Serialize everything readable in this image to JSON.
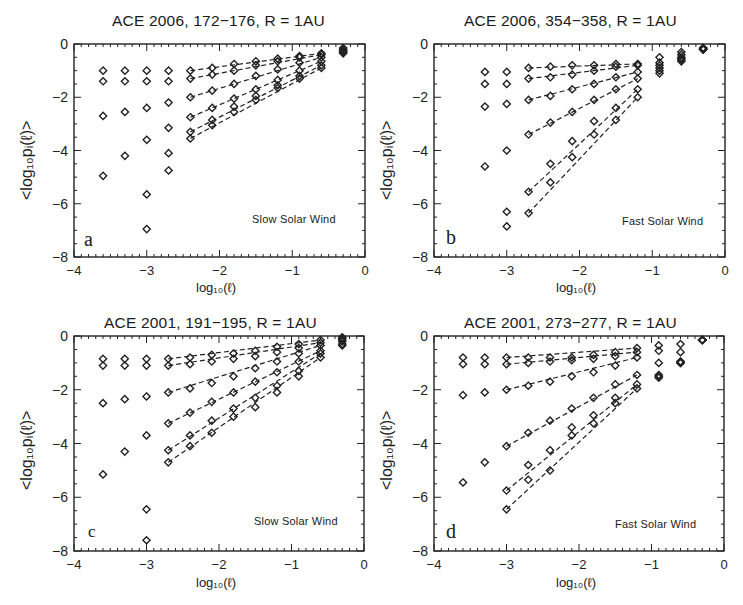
{
  "figure": {
    "ylabel": "<log₁₀pᵢ(ℓ)>",
    "xlabel": "log₁₀(ℓ)",
    "xticks": [
      "−4",
      "−3",
      "−2",
      "−1",
      "0"
    ],
    "yticks": [
      "0",
      "−2",
      "−4",
      "−6",
      "−8"
    ]
  },
  "chart_data": [
    {
      "panel": "a",
      "type": "scatter",
      "title": "ACE 2006, 172−176, R = 1AU",
      "annotation": "Slow Solar Wind",
      "xlabel": "log10(l)",
      "ylabel": "<log10 pi(l)>",
      "xlim": [
        -4,
        0
      ],
      "ylim": [
        -8,
        0
      ],
      "grid": false,
      "marker": "diamond",
      "fit_lines": "dashed",
      "fit_range": [
        -2.4,
        -0.6
      ],
      "x": [
        -3.6,
        -3.3,
        -3.0,
        -2.7,
        -2.4,
        -2.1,
        -1.8,
        -1.5,
        -1.2,
        -0.9,
        -0.6,
        -0.3
      ],
      "series": [
        {
          "name": "1",
          "values": [
            -1.0,
            -1.0,
            -1.0,
            -1.0,
            -1.0,
            -0.9,
            -0.75,
            -0.65,
            -0.55,
            -0.45,
            -0.35,
            -0.15
          ]
        },
        {
          "name": "2",
          "values": [
            -1.4,
            -1.4,
            -1.4,
            -1.4,
            -1.3,
            -1.15,
            -1.0,
            -0.8,
            -0.65,
            -0.5,
            -0.4,
            -0.2
          ]
        },
        {
          "name": "3",
          "values": [
            -2.7,
            -2.55,
            -2.4,
            -2.2,
            -2.0,
            -1.75,
            -1.5,
            -1.2,
            -0.95,
            -0.7,
            -0.5,
            -0.25
          ]
        },
        {
          "name": "4",
          "values": [
            -4.95,
            -4.2,
            -3.6,
            -3.15,
            -2.75,
            -2.4,
            -2.05,
            -1.7,
            -1.35,
            -1.0,
            -0.65,
            -0.3
          ]
        },
        {
          "name": "5",
          "values": [
            null,
            null,
            -5.65,
            -4.1,
            -3.3,
            -2.85,
            -2.35,
            -1.95,
            -1.55,
            -1.2,
            -0.8,
            -0.3
          ]
        },
        {
          "name": "6",
          "values": [
            null,
            null,
            -6.95,
            -4.75,
            -3.55,
            -3.05,
            -2.55,
            -2.1,
            -1.65,
            -1.3,
            -0.9,
            -0.35
          ]
        }
      ]
    },
    {
      "panel": "b",
      "type": "scatter",
      "title": "ACE 2006, 354−358, R = 1AU",
      "annotation": "Fast Solar Wind",
      "xlabel": "log10(l)",
      "ylabel": "<log10 pi(l)>",
      "xlim": [
        -4,
        0
      ],
      "ylim": [
        -8,
        0
      ],
      "grid": false,
      "marker": "diamond",
      "fit_lines": "dashed",
      "fit_range": [
        -2.7,
        -1.2
      ],
      "x": [
        -3.3,
        -3.0,
        -2.7,
        -2.4,
        -2.1,
        -1.8,
        -1.5,
        -1.2,
        -0.9,
        -0.6,
        -0.3
      ],
      "series": [
        {
          "name": "1",
          "values": [
            -1.05,
            -1.05,
            -0.9,
            -0.85,
            -0.8,
            -0.8,
            -0.75,
            -0.75,
            -0.5,
            -0.3,
            -0.15
          ]
        },
        {
          "name": "2",
          "values": [
            -1.5,
            -1.5,
            -1.3,
            -1.25,
            -1.15,
            -1.0,
            -0.85,
            -0.8,
            -0.7,
            -0.4,
            -0.15
          ]
        },
        {
          "name": "3",
          "values": [
            -2.35,
            -2.25,
            -2.1,
            -1.95,
            -1.7,
            -1.5,
            -1.25,
            -1.05,
            -0.8,
            -0.5,
            -0.2
          ]
        },
        {
          "name": "4",
          "values": [
            -4.6,
            -4.0,
            -3.4,
            -2.95,
            -2.55,
            -2.1,
            -1.7,
            -1.3,
            -0.9,
            -0.55,
            -0.2
          ]
        },
        {
          "name": "5",
          "values": [
            null,
            -6.3,
            -5.55,
            -4.5,
            -3.65,
            -2.9,
            -2.4,
            -1.7,
            -1.0,
            -0.6,
            -0.2
          ]
        },
        {
          "name": "6",
          "values": [
            null,
            -6.85,
            -6.35,
            -5.2,
            -4.25,
            -3.4,
            -2.85,
            -2.0,
            -1.1,
            -0.65,
            -0.2
          ]
        }
      ]
    },
    {
      "panel": "c",
      "type": "scatter",
      "title": "ACE 2001, 191−195, R = 1AU",
      "annotation": "Slow Solar Wind",
      "xlabel": "log10(l)",
      "ylabel": "<log10 pi(l)>",
      "xlim": [
        -4,
        0
      ],
      "ylim": [
        -8,
        0
      ],
      "grid": false,
      "marker": "diamond",
      "fit_lines": "dashed",
      "fit_range": [
        -2.7,
        -0.6
      ],
      "x": [
        -3.6,
        -3.3,
        -3.0,
        -2.7,
        -2.4,
        -2.1,
        -1.8,
        -1.5,
        -1.2,
        -0.9,
        -0.6,
        -0.3
      ],
      "series": [
        {
          "name": "1",
          "values": [
            -0.85,
            -0.85,
            -0.85,
            -0.85,
            -0.8,
            -0.7,
            -0.65,
            -0.55,
            -0.4,
            -0.3,
            -0.15,
            -0.05
          ]
        },
        {
          "name": "2",
          "values": [
            -1.1,
            -1.1,
            -1.1,
            -1.1,
            -1.05,
            -0.95,
            -0.85,
            -0.75,
            -0.6,
            -0.45,
            -0.25,
            -0.1
          ]
        },
        {
          "name": "3",
          "values": [
            -2.5,
            -2.35,
            -2.25,
            -2.1,
            -1.95,
            -1.75,
            -1.5,
            -1.2,
            -0.95,
            -0.65,
            -0.35,
            -0.15
          ]
        },
        {
          "name": "4",
          "values": [
            -5.15,
            -4.3,
            -3.7,
            -3.25,
            -2.85,
            -2.45,
            -2.1,
            -1.7,
            -1.35,
            -0.95,
            -0.55,
            -0.2
          ]
        },
        {
          "name": "5",
          "values": [
            null,
            null,
            -6.45,
            -4.25,
            -3.7,
            -3.15,
            -2.7,
            -2.3,
            -1.85,
            -1.3,
            -0.65,
            -0.3
          ]
        },
        {
          "name": "6",
          "values": [
            null,
            null,
            -7.6,
            -4.7,
            -4.1,
            -3.6,
            -3.0,
            -2.65,
            -2.1,
            -1.5,
            -0.8,
            -0.35
          ]
        }
      ]
    },
    {
      "panel": "d",
      "type": "scatter",
      "title": "ACE 2001, 273−277, R = 1AU",
      "annotation": "Fast Solar Wind",
      "xlabel": "log10(l)",
      "ylabel": "<log10 pi(l)>",
      "xlim": [
        -4,
        0
      ],
      "ylim": [
        -8,
        0
      ],
      "grid": false,
      "marker": "diamond",
      "fit_lines": "dashed",
      "fit_range": [
        -3.0,
        -1.2
      ],
      "x": [
        -3.6,
        -3.3,
        -3.0,
        -2.7,
        -2.4,
        -2.1,
        -1.8,
        -1.5,
        -1.2,
        -0.9,
        -0.6,
        -0.3
      ],
      "series": [
        {
          "name": "1",
          "values": [
            -0.8,
            -0.8,
            -0.8,
            -0.8,
            -0.8,
            -0.8,
            -0.7,
            -0.6,
            -0.45,
            -0.35,
            -0.3,
            -0.15
          ]
        },
        {
          "name": "2",
          "values": [
            -1.05,
            -1.05,
            -1.05,
            -1.0,
            -0.95,
            -0.9,
            -0.85,
            -0.75,
            -0.6,
            -0.55,
            -0.6,
            -0.15
          ]
        },
        {
          "name": "3",
          "values": [
            -2.2,
            -2.1,
            -2.0,
            -1.85,
            -1.7,
            -1.5,
            -1.35,
            -1.1,
            -0.8,
            -1.0,
            -0.95,
            -0.15
          ]
        },
        {
          "name": "4",
          "values": [
            -5.45,
            -4.7,
            -4.1,
            -3.6,
            -3.15,
            -2.7,
            -2.3,
            -1.8,
            -1.45,
            -1.45,
            -0.95,
            -0.15
          ]
        },
        {
          "name": "5",
          "values": [
            null,
            null,
            -5.75,
            -4.8,
            -4.25,
            -3.4,
            -2.95,
            -2.3,
            -1.8,
            -1.5,
            -1.0,
            -0.15
          ]
        },
        {
          "name": "6",
          "values": [
            null,
            null,
            -6.45,
            -5.35,
            -5.0,
            -3.7,
            -3.25,
            -2.5,
            -1.95,
            -1.55,
            -1.0,
            -0.15
          ]
        }
      ]
    }
  ]
}
